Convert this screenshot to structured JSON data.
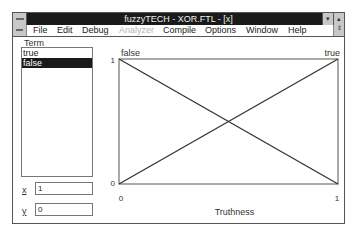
{
  "window": {
    "title": "fuzzyTECH - XOR.FTL - [x]",
    "minimize_glyph": "▾",
    "maximize_glyph": "▴",
    "restore_glyph": "⇕"
  },
  "menu": {
    "items": [
      {
        "label": "File",
        "enabled": true
      },
      {
        "label": "Edit",
        "enabled": true
      },
      {
        "label": "Debug",
        "enabled": true
      },
      {
        "label": "Analyzer",
        "enabled": false
      },
      {
        "label": "Compile",
        "enabled": true
      },
      {
        "label": "Options",
        "enabled": true
      },
      {
        "label": "Window",
        "enabled": true
      },
      {
        "label": "Help",
        "enabled": true
      }
    ]
  },
  "term_panel": {
    "label": "Term",
    "terms": [
      {
        "label": "true",
        "selected": false
      },
      {
        "label": "false",
        "selected": true
      }
    ],
    "x_label": "x",
    "x_value": "1",
    "y_label": "y",
    "y_value": "0"
  },
  "chart_data": {
    "type": "line",
    "title": "",
    "xlabel": "Truthness",
    "ylabel": "",
    "xlim": [
      0,
      1
    ],
    "ylim": [
      0,
      1
    ],
    "x_ticks": [
      "0",
      "1"
    ],
    "y_ticks": [
      "0",
      "1"
    ],
    "series": [
      {
        "name": "false",
        "x": [
          0,
          1
        ],
        "y": [
          1,
          0
        ]
      },
      {
        "name": "true",
        "x": [
          0,
          1
        ],
        "y": [
          0,
          1
        ]
      }
    ],
    "legend": [
      "false",
      "true"
    ],
    "grid": false
  }
}
